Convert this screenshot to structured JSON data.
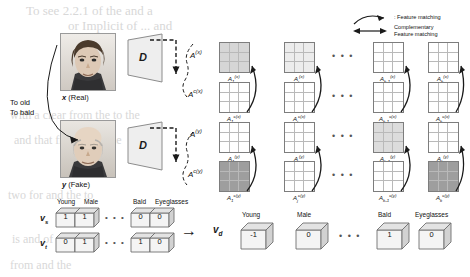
{
  "figure": {
    "background_text": [
      "To see 2.2.1 of the  and  a",
      "or Implicit  of   ...   and",
      "  with a clear  from the   to  the",
      "and   that  from  of  in the",
      "two   for   and  the   to",
      "is  and   of  the",
      "  from    and   the"
    ],
    "inputs": [
      {
        "id": "x",
        "label": "x",
        "suffix": "(Real)",
        "discriminator": "D"
      },
      {
        "id": "y",
        "label": "y",
        "suffix": "(Fake)",
        "discriminator": "D"
      }
    ],
    "transform_label_lines": [
      "To old",
      "To bald"
    ],
    "feature_rows": [
      {
        "row_label": "A",
        "row_sup": "(x)",
        "matrices": [
          {
            "name": "A_1_x",
            "sub": "1",
            "sup": "(x)",
            "shade": "light"
          },
          {
            "name": "A_j_x",
            "sub": "j",
            "sup": "(x)",
            "shade": "verylight"
          },
          {
            "name": "A_k-1_x",
            "sub": "k-1",
            "sup": "(x)",
            "shade": "none"
          },
          {
            "name": "A_k_x",
            "sub": "k",
            "sup": "(x)",
            "shade": "none"
          }
        ]
      },
      {
        "row_label": "A",
        "row_sup": "c(x)",
        "matrices": [
          {
            "name": "A_1_cx",
            "sub": "1",
            "sup": "c(x)",
            "shade": "none"
          },
          {
            "name": "A_j_cx",
            "sub": "j",
            "sup": "c(x)",
            "shade": "none"
          },
          {
            "name": "A_k-1_cx",
            "sub": "k-1",
            "sup": "c(x)",
            "shade": "none"
          },
          {
            "name": "A_k_cx",
            "sub": "k",
            "sup": "c(x)",
            "shade": "none"
          }
        ]
      },
      {
        "row_label": "A",
        "row_sup": "(y)",
        "matrices": [
          {
            "name": "A_1_y",
            "sub": "1",
            "sup": "(y)",
            "shade": "none"
          },
          {
            "name": "A_j_y",
            "sub": "j",
            "sup": "(y)",
            "shade": "none"
          },
          {
            "name": "A_k-1_y",
            "sub": "k-1",
            "sup": "(y)",
            "shade": "light"
          },
          {
            "name": "A_k_y",
            "sub": "k",
            "sup": "(y)",
            "shade": "none"
          }
        ]
      },
      {
        "row_label": "A",
        "row_sup": "c(y)",
        "matrices": [
          {
            "name": "A_1_cy",
            "sub": "1",
            "sup": "c(y)",
            "shade": "dark"
          },
          {
            "name": "A_j_cy",
            "sub": "j",
            "sup": "c(y)",
            "shade": "none"
          },
          {
            "name": "A_k-1_cy",
            "sub": "k-1",
            "sup": "c(y)",
            "shade": "none"
          },
          {
            "name": "A_k_cy",
            "sub": "k",
            "sup": "c(y)",
            "shade": "dark"
          }
        ]
      }
    ],
    "ellipsis": "• • •",
    "legend": [
      {
        "symbol": "curved-arrow",
        "text": ": Feature matching"
      },
      {
        "symbol": "double-arrow",
        "text_line1": "Complementary",
        "text_line2": "Feature matching"
      }
    ],
    "vectors": {
      "source": {
        "name": "v_s",
        "label": "v",
        "sub": "s",
        "left_values": [
          "1",
          "1"
        ],
        "right_values": [
          "0",
          "0"
        ]
      },
      "target": {
        "name": "v_t",
        "label": "v",
        "sub": "t",
        "left_values": [
          "0",
          "1"
        ],
        "right_values": [
          "1",
          "0"
        ]
      },
      "diff": {
        "name": "v_d",
        "label": "v",
        "sub": "d",
        "values": [
          "-1",
          "0",
          "1",
          "0"
        ]
      },
      "attributes_left": [
        "Young",
        "Male"
      ],
      "attributes_right": [
        "Bald",
        "Eyeglasses"
      ],
      "attributes_diff": [
        "Young",
        "Male",
        "Bald",
        "Eyeglasses"
      ],
      "arrow": "→"
    },
    "colors": {
      "ink": "#1a1a1a",
      "grid_line": "#b9b9b9",
      "grid_border": "#7d7d7d",
      "shade_light": "#d6d6d6",
      "shade_verylight": "#ececec",
      "shade_dark": "#9e9e9e",
      "bleed": "#d8d8d8"
    }
  }
}
